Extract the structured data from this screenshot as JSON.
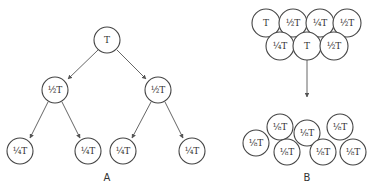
{
  "diagram": {
    "panels": [
      {
        "id": "A",
        "label": "A",
        "label_pos": [
          107,
          181
        ],
        "nodes": [
          {
            "id": "a-root",
            "text": "T",
            "cx": 107,
            "cy": 40,
            "r": 13
          },
          {
            "id": "a-l",
            "text": "½T",
            "cx": 55,
            "cy": 90,
            "r": 13
          },
          {
            "id": "a-r",
            "text": "½T",
            "cx": 158,
            "cy": 90,
            "r": 13
          },
          {
            "id": "a-ll",
            "text": "¼T",
            "cx": 20,
            "cy": 151,
            "r": 13
          },
          {
            "id": "a-lr",
            "text": "¼T",
            "cx": 88,
            "cy": 151,
            "r": 13
          },
          {
            "id": "a-rl",
            "text": "¼T",
            "cx": 123,
            "cy": 151,
            "r": 13
          },
          {
            "id": "a-rr",
            "text": "¼T",
            "cx": 192,
            "cy": 151,
            "r": 13
          }
        ],
        "edges": [
          {
            "from": [
              98,
              50
            ],
            "to": [
              68,
              79
            ]
          },
          {
            "from": [
              117,
              50
            ],
            "to": [
              146,
              79
            ]
          },
          {
            "from": [
              48,
              102
            ],
            "to": [
              30,
              138
            ]
          },
          {
            "from": [
              62,
              102
            ],
            "to": [
              80,
              138
            ]
          },
          {
            "from": [
              151,
              102
            ],
            "to": [
              132,
              138
            ]
          },
          {
            "from": [
              165,
              102
            ],
            "to": [
              183,
              138
            ]
          }
        ]
      },
      {
        "id": "B",
        "label": "B",
        "label_pos": [
          307,
          181
        ],
        "nodes": [
          {
            "id": "b1",
            "text": "T",
            "cx": 266,
            "cy": 23,
            "r": 14
          },
          {
            "id": "b2",
            "text": "½T",
            "cx": 293,
            "cy": 23,
            "r": 14
          },
          {
            "id": "b3",
            "text": "¼T",
            "cx": 320,
            "cy": 23,
            "r": 14
          },
          {
            "id": "b4",
            "text": "½T",
            "cx": 347,
            "cy": 23,
            "r": 14
          },
          {
            "id": "b5",
            "text": "¼T",
            "cx": 280,
            "cy": 46,
            "r": 14
          },
          {
            "id": "b6",
            "text": "T",
            "cx": 307,
            "cy": 46,
            "r": 14
          },
          {
            "id": "b7",
            "text": "½T",
            "cx": 334,
            "cy": 46,
            "r": 14
          },
          {
            "id": "b8",
            "text": "⅛T",
            "cx": 280,
            "cy": 127,
            "r": 13
          },
          {
            "id": "b9",
            "text": "⅛T",
            "cx": 256,
            "cy": 143,
            "r": 13
          },
          {
            "id": "b10",
            "text": "⅛T",
            "cx": 287,
            "cy": 152,
            "r": 13
          },
          {
            "id": "b11",
            "text": "⅛T",
            "cx": 307,
            "cy": 133,
            "r": 13
          },
          {
            "id": "b12",
            "text": "⅛T",
            "cx": 340,
            "cy": 127,
            "r": 13
          },
          {
            "id": "b13",
            "text": "⅛T",
            "cx": 323,
            "cy": 152,
            "r": 13
          },
          {
            "id": "b14",
            "text": "⅛T",
            "cx": 353,
            "cy": 152,
            "r": 13
          }
        ],
        "edges": [
          {
            "from": [
              307,
              60
            ],
            "to": [
              307,
              97
            ]
          }
        ]
      }
    ]
  }
}
